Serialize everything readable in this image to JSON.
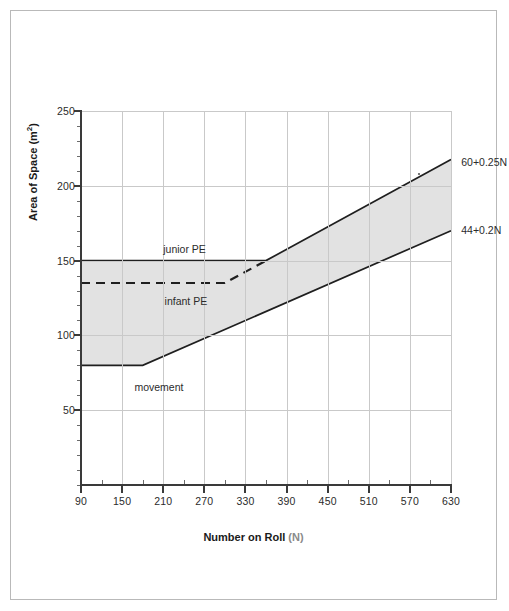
{
  "chart_data": {
    "type": "area",
    "title": "",
    "xlabel": "Number on Roll (N)",
    "xlabel_main": "Number on Roll",
    "xlabel_suffix": "(N)",
    "ylabel": "Area of Space (m²)",
    "ylabel_main": "Area of Space (m",
    "ylabel_sup": "2",
    "ylabel_close": ")",
    "xlim": [
      90,
      630
    ],
    "ylim": [
      0,
      250
    ],
    "xticks": [
      90,
      150,
      210,
      270,
      330,
      390,
      450,
      510,
      570,
      630
    ],
    "xtick_labels": [
      "90",
      "150",
      "210",
      "270",
      "330",
      "390",
      "450",
      "510",
      "570",
      "630"
    ],
    "xminor_step": 30,
    "yticks": [
      50,
      100,
      150,
      200,
      250
    ],
    "ytick_labels": [
      "50",
      "100",
      "150",
      "200",
      "250"
    ],
    "yminor_step": 10,
    "grid": true,
    "legend": "none",
    "band_fill": "#e2e2e2",
    "line_color": "#1f1f1f",
    "grid_color": "#c9c9c9",
    "axis_color": "#3a3a3a",
    "series": [
      {
        "name": "upper-boundary",
        "formula": "60+0.25N",
        "label": "60+0.25N",
        "style": "solid",
        "points": [
          [
            90,
            150
          ],
          [
            360,
            150
          ],
          [
            630,
            217.5
          ]
        ]
      },
      {
        "name": "lower-boundary",
        "formula": "44+0.2N",
        "label": "44+0.2N",
        "style": "solid",
        "points": [
          [
            90,
            80
          ],
          [
            180,
            80
          ],
          [
            630,
            170
          ]
        ]
      },
      {
        "name": "infant-pe-boundary",
        "formula": "",
        "label": "infant PE",
        "style": "dashed",
        "points": [
          [
            90,
            135
          ],
          [
            300,
            135
          ],
          [
            360,
            150
          ]
        ]
      }
    ],
    "annotations": [
      {
        "name": "junior-pe-label",
        "text": "junior PE",
        "x": 210,
        "y": 157
      },
      {
        "name": "infant-pe-label",
        "text": "infant PE",
        "x": 212,
        "y": 122
      },
      {
        "name": "movement-label",
        "text": "movement",
        "x": 168,
        "y": 65
      },
      {
        "name": "upper-formula-label",
        "text": "60+0.25N",
        "x": 645,
        "y": 215
      },
      {
        "name": "lower-formula-label",
        "text": "44+0.2N",
        "x": 645,
        "y": 170
      }
    ]
  }
}
